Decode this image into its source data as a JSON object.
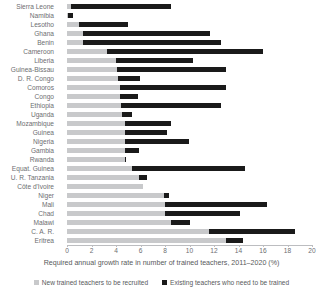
{
  "chart_data": {
    "type": "bar",
    "orientation": "horizontal",
    "stacked": true,
    "title": "",
    "xlabel": "Required annual growth rate in number of trained teachers, 2011–2020 (%)",
    "ylabel": "",
    "xlim": [
      0,
      20
    ],
    "xticks": [
      0,
      2,
      4,
      6,
      8,
      10,
      12,
      14,
      16,
      18,
      20
    ],
    "grid": false,
    "legend_position": "bottom",
    "colors": {
      "recruited": "#c8c9cb",
      "existing": "#1a1a1a",
      "axis": "#bcbdc0",
      "text": "#58595b"
    },
    "series": [
      {
        "name": "New trained teachers to be recruited",
        "key": "recruited",
        "color": "#c8c9cb"
      },
      {
        "name": "Existing teachers who need to be trained",
        "key": "existing",
        "color": "#1a1a1a"
      }
    ],
    "categories": [
      "Sierra Leone",
      "Namibia",
      "Lesotho",
      "Ghana",
      "Benin",
      "Cameroon",
      "Liberia",
      "Guinea-Bissau",
      "D. R. Congo",
      "Comoros",
      "Congo",
      "Ethiopia",
      "Uganda",
      "Mozambique",
      "Guinea",
      "Nigeria",
      "Gambia",
      "Rwanda",
      "Equat. Guinea",
      "U. R. Tanzania",
      "Côte d'Ivoire",
      "Niger",
      "Mali",
      "Chad",
      "Malawi",
      "C. A. R.",
      "Eritrea"
    ],
    "rows": [
      {
        "country": "Sierra Leone",
        "recruited": 0.3,
        "existing": 8.2,
        "total": 8.5
      },
      {
        "country": "Namibia",
        "recruited": 0.1,
        "existing": 0.4,
        "total": 0.5
      },
      {
        "country": "Lesotho",
        "recruited": 1.0,
        "existing": 4.0,
        "total": 5.0
      },
      {
        "country": "Ghana",
        "recruited": 1.3,
        "existing": 10.4,
        "total": 11.7
      },
      {
        "country": "Benin",
        "recruited": 1.3,
        "existing": 11.3,
        "total": 12.6
      },
      {
        "country": "Cameroon",
        "recruited": 3.3,
        "existing": 12.7,
        "total": 16.0
      },
      {
        "country": "Liberia",
        "recruited": 4.0,
        "existing": 6.3,
        "total": 10.3
      },
      {
        "country": "Guinea-Bissau",
        "recruited": 4.1,
        "existing": 8.9,
        "total": 13.0
      },
      {
        "country": "D. R. Congo",
        "recruited": 4.2,
        "existing": 1.8,
        "total": 6.0
      },
      {
        "country": "Comoros",
        "recruited": 4.3,
        "existing": 8.7,
        "total": 13.0
      },
      {
        "country": "Congo",
        "recruited": 4.3,
        "existing": 1.5,
        "total": 5.8
      },
      {
        "country": "Ethiopia",
        "recruited": 4.4,
        "existing": 8.2,
        "total": 12.6
      },
      {
        "country": "Uganda",
        "recruited": 4.5,
        "existing": 0.8,
        "total": 5.3
      },
      {
        "country": "Mozambique",
        "recruited": 4.7,
        "existing": 3.8,
        "total": 8.5
      },
      {
        "country": "Guinea",
        "recruited": 4.7,
        "existing": 3.5,
        "total": 8.2
      },
      {
        "country": "Nigeria",
        "recruited": 4.7,
        "existing": 5.3,
        "total": 10.0
      },
      {
        "country": "Gambia",
        "recruited": 4.7,
        "existing": 1.2,
        "total": 5.9
      },
      {
        "country": "Rwanda",
        "recruited": 4.7,
        "existing": 0.1,
        "total": 4.8
      },
      {
        "country": "Equat. Guinea",
        "recruited": 5.3,
        "existing": 9.2,
        "total": 14.5
      },
      {
        "country": "U. R. Tanzania",
        "recruited": 5.9,
        "existing": 0.6,
        "total": 6.5
      },
      {
        "country": "Côte d'Ivoire",
        "recruited": 6.2,
        "existing": 0.0,
        "total": 6.2
      },
      {
        "country": "Niger",
        "recruited": 7.9,
        "existing": 0.4,
        "total": 8.3
      },
      {
        "country": "Mali",
        "recruited": 8.0,
        "existing": 8.3,
        "total": 16.3
      },
      {
        "country": "Chad",
        "recruited": 8.0,
        "existing": 6.1,
        "total": 14.1
      },
      {
        "country": "Malawi",
        "recruited": 8.5,
        "existing": 1.5,
        "total": 10.0
      },
      {
        "country": "C. A. R.",
        "recruited": 11.6,
        "existing": 7.0,
        "total": 18.6
      },
      {
        "country": "Eritrea",
        "recruited": 13.0,
        "existing": 1.4,
        "total": 14.4
      }
    ]
  },
  "legend": {
    "items": [
      {
        "label": "New trained teachers to be recruited",
        "swatch": "gray"
      },
      {
        "label": "Existing teachers who need to be trained",
        "swatch": "black"
      }
    ]
  }
}
